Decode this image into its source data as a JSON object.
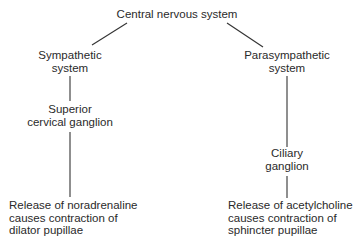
{
  "diagram": {
    "root": {
      "label": "Central nervous system"
    },
    "sympathetic": {
      "system": {
        "line1": "Sympathetic",
        "line2": "system"
      },
      "ganglion": {
        "line1": "Superior",
        "line2": "cervical ganglion"
      },
      "effect": {
        "line1": "Release of noradrenaline",
        "line2": "causes contraction of",
        "line3": "dilator pupillae"
      }
    },
    "parasympathetic": {
      "system": {
        "line1": "Parasympathetic",
        "line2": "system"
      },
      "ganglion": {
        "line1": "Ciliary",
        "line2": "ganglion"
      },
      "effect": {
        "line1": "Release of acetylcholine",
        "line2": "causes contraction of",
        "line3": "sphincter pupillae"
      }
    },
    "line_color": "#333333"
  }
}
